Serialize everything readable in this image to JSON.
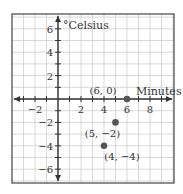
{
  "chart_data": {
    "type": "scatter",
    "title": "",
    "xlabel": "Minutes",
    "ylabel": "°Celsius",
    "xlim": [
      -3,
      9
    ],
    "ylim": [
      -6.5,
      6.5
    ],
    "grid": true,
    "x_ticks": [
      -2,
      2,
      4,
      6,
      8
    ],
    "x_tick_labels": [
      "−2",
      "2",
      "4",
      "6",
      "8"
    ],
    "y_ticks": [
      6,
      4,
      2,
      -2,
      -4,
      -6
    ],
    "y_tick_labels": [
      "6",
      "4",
      "2",
      "−2",
      "−4",
      "−6"
    ],
    "points": [
      {
        "x": 6,
        "y": 0,
        "label": "(6, 0)"
      },
      {
        "x": 5,
        "y": -2,
        "label": "(5, −2)"
      },
      {
        "x": 4,
        "y": -4,
        "label": "(4, −4)"
      }
    ],
    "legend": null
  },
  "colors": {
    "grid": "#c8c8c8",
    "axis": "#333333",
    "point": "#555555",
    "frame": "#444444"
  }
}
